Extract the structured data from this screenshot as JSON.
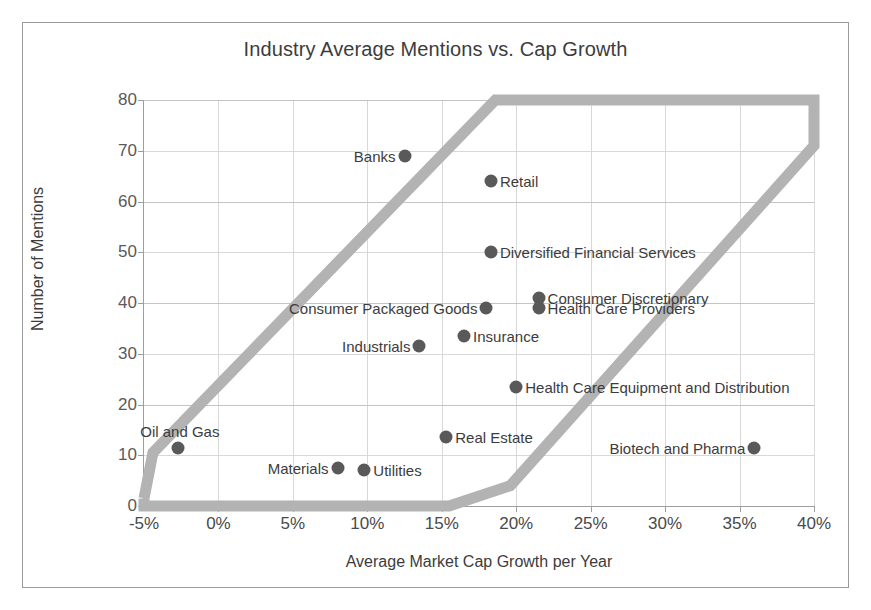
{
  "chart_data": {
    "type": "scatter",
    "title": "Industry Average Mentions vs. Cap Growth",
    "xlabel": "Average Market Cap Growth per Year",
    "ylabel": "Number of Mentions",
    "xlim": [
      -5,
      40
    ],
    "ylim": [
      0,
      80
    ],
    "xticks": [
      "-5%",
      "0%",
      "5%",
      "10%",
      "15%",
      "20%",
      "25%",
      "30%",
      "35%",
      "40%"
    ],
    "xtick_values": [
      -5,
      0,
      5,
      10,
      15,
      20,
      25,
      30,
      35,
      40
    ],
    "yticks": [
      "0",
      "10",
      "20",
      "30",
      "40",
      "50",
      "60",
      "70",
      "80"
    ],
    "ytick_values": [
      0,
      10,
      20,
      30,
      40,
      50,
      60,
      70,
      80
    ],
    "grid": true,
    "legend": "none",
    "marker_color": "#595959",
    "band_color": "#b3b3b3",
    "points": [
      {
        "label": "Banks",
        "x": 12.5,
        "y": 69,
        "label_side": "left"
      },
      {
        "label": "Retail",
        "x": 18.3,
        "y": 64,
        "label_side": "right"
      },
      {
        "label": "Diversified Financial Services",
        "x": 18.3,
        "y": 50,
        "label_side": "right"
      },
      {
        "label": "Consumer Discretionary",
        "x": 21.5,
        "y": 41,
        "label_side": "right"
      },
      {
        "label": "Health Care Providers",
        "x": 21.5,
        "y": 39,
        "label_side": "right"
      },
      {
        "label": "Consumer Packaged Goods",
        "x": 18.0,
        "y": 39,
        "label_side": "left"
      },
      {
        "label": "Insurance",
        "x": 16.5,
        "y": 33.5,
        "label_side": "right"
      },
      {
        "label": "Industrials",
        "x": 13.5,
        "y": 31.5,
        "label_side": "left"
      },
      {
        "label": "Health Care Equipment and Distribution",
        "x": 20.0,
        "y": 23.5,
        "label_side": "right"
      },
      {
        "label": "Real Estate",
        "x": 15.3,
        "y": 13.5,
        "label_side": "right"
      },
      {
        "label": "Oil and Gas",
        "x": -2.7,
        "y": 11.5,
        "label_side": "above"
      },
      {
        "label": "Biotech and Pharma",
        "x": 36.0,
        "y": 11.5,
        "label_side": "left"
      },
      {
        "label": "Materials",
        "x": 8.0,
        "y": 7.5,
        "label_side": "left"
      },
      {
        "label": "Utilities",
        "x": 9.8,
        "y": 7.0,
        "label_side": "right"
      }
    ],
    "annotations": [
      {
        "name": "trend-corridor-band",
        "description": "Thick gray diagonal band marking the correlation corridor"
      }
    ]
  }
}
